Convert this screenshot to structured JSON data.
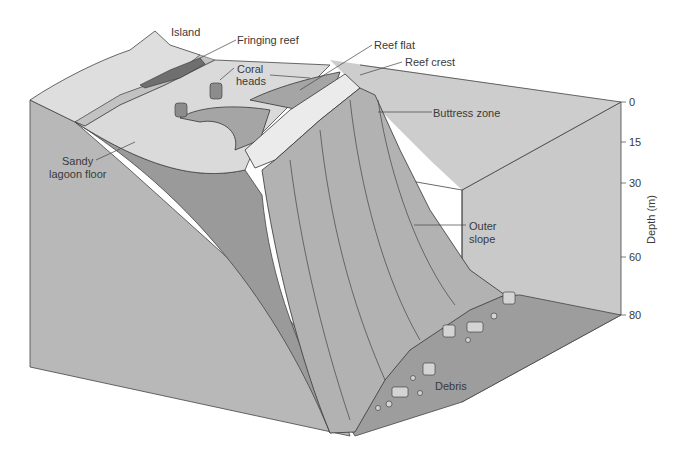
{
  "diagram": {
    "labels": {
      "island": "Island",
      "fringing_reef": "Fringing reef",
      "coral_heads_1": "Coral",
      "coral_heads_2": "heads",
      "reef_flat": "Reef flat",
      "reef_crest": "Reef crest",
      "buttress_zone": "Buttress zone",
      "sandy_lagoon_floor_1": "Sandy",
      "sandy_lagoon_floor_2": "lagoon floor",
      "outer_slope_1": "Outer",
      "outer_slope_2": "slope",
      "debris": "Debris"
    },
    "depth_axis": {
      "title": "Depth (m)",
      "ticks": [
        "0",
        "15",
        "30",
        "60",
        "80"
      ]
    },
    "colors": {
      "box_face": "#b9b9b9",
      "box_back": "#c8c8c8",
      "floor": "#9a9a9a",
      "lagoon_sand": "#d9d9d9",
      "island_top": "#dcdcdc",
      "reef_dark": "#7c7c7c",
      "reef_mid": "#a8a8a8",
      "slope": "#b0b0b0",
      "wedge": "#9b9b9b",
      "line": "#333333"
    }
  }
}
